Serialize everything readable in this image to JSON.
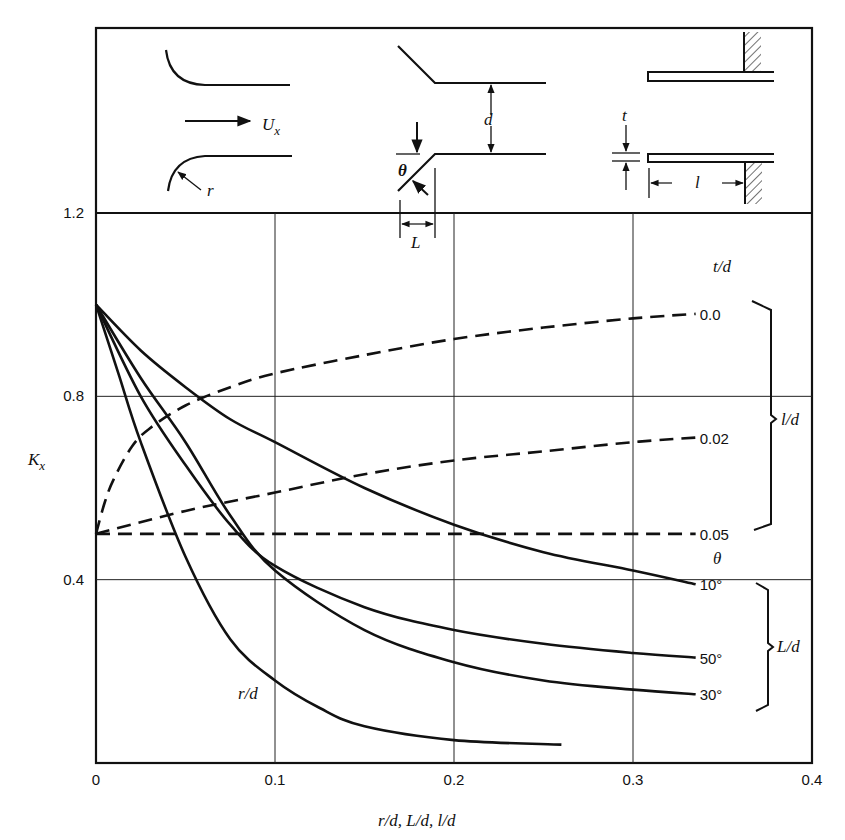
{
  "chart_data": {
    "type": "line",
    "title": "",
    "xlabel": "r/d, L/d, l/d",
    "ylabel": "K_x",
    "xlim": [
      0,
      0.4
    ],
    "ylim": [
      0,
      1.2
    ],
    "x_ticks": [
      "0",
      "0.1",
      "0.2",
      "0.3",
      "0.4"
    ],
    "y_ticks": [
      "0.4",
      "0.8",
      "1.2"
    ],
    "grid": true,
    "legend_groups": [
      {
        "header": "t/d",
        "bracket_label": "l/d",
        "style": "dashed",
        "entries": [
          "0.0",
          "0.02",
          "0.05"
        ]
      },
      {
        "header": "θ",
        "bracket_label": "L/d",
        "style": "solid",
        "entries": [
          "10°",
          "50°",
          "30°"
        ]
      }
    ],
    "series": [
      {
        "name": "t/d = 0.0",
        "group": "l/d",
        "style": "dashed",
        "label": "0.0",
        "x": [
          0,
          0.005,
          0.01,
          0.02,
          0.03,
          0.05,
          0.075,
          0.1,
          0.15,
          0.2,
          0.25,
          0.3,
          0.335
        ],
        "y": [
          0.5,
          0.57,
          0.62,
          0.69,
          0.73,
          0.78,
          0.82,
          0.85,
          0.89,
          0.925,
          0.95,
          0.97,
          0.98
        ]
      },
      {
        "name": "t/d = 0.02",
        "group": "l/d",
        "style": "dashed",
        "label": "0.02",
        "x": [
          0,
          0.05,
          0.1,
          0.15,
          0.2,
          0.25,
          0.3,
          0.335
        ],
        "y": [
          0.5,
          0.55,
          0.59,
          0.63,
          0.66,
          0.68,
          0.7,
          0.71
        ]
      },
      {
        "name": "t/d = 0.05",
        "group": "l/d",
        "style": "dashed",
        "label": "0.05",
        "x": [
          0,
          0.1,
          0.2,
          0.3,
          0.335
        ],
        "y": [
          0.5,
          0.5,
          0.5,
          0.5,
          0.5
        ]
      },
      {
        "name": "θ = 10°",
        "group": "L/d",
        "style": "solid",
        "label": "10°",
        "x": [
          0,
          0.025,
          0.05,
          0.075,
          0.1,
          0.15,
          0.2,
          0.25,
          0.3,
          0.335
        ],
        "y": [
          1.0,
          0.9,
          0.82,
          0.75,
          0.7,
          0.6,
          0.52,
          0.46,
          0.42,
          0.39
        ]
      },
      {
        "name": "θ = 50°",
        "group": "L/d",
        "style": "solid",
        "label": "50°",
        "x": [
          0,
          0.025,
          0.05,
          0.075,
          0.1,
          0.15,
          0.2,
          0.25,
          0.3,
          0.335
        ],
        "y": [
          1.0,
          0.8,
          0.65,
          0.52,
          0.43,
          0.34,
          0.29,
          0.26,
          0.24,
          0.23
        ]
      },
      {
        "name": "θ = 30°",
        "group": "L/d",
        "style": "solid",
        "label": "30°",
        "x": [
          0,
          0.025,
          0.05,
          0.075,
          0.1,
          0.15,
          0.2,
          0.25,
          0.3,
          0.335
        ],
        "y": [
          1.0,
          0.84,
          0.7,
          0.54,
          0.42,
          0.29,
          0.22,
          0.18,
          0.16,
          0.15
        ]
      },
      {
        "name": "r/d",
        "group": "r/d",
        "style": "solid",
        "label": "r/d",
        "x": [
          0,
          0.0125,
          0.025,
          0.05,
          0.075,
          0.1,
          0.125,
          0.15,
          0.2,
          0.26
        ],
        "y": [
          1.0,
          0.85,
          0.7,
          0.45,
          0.27,
          0.18,
          0.12,
          0.08,
          0.05,
          0.04
        ]
      }
    ],
    "inset_diagrams": [
      {
        "name": "rounded-inlet",
        "labels": [
          "U_x",
          "r"
        ]
      },
      {
        "name": "chamfered-inlet",
        "labels": [
          "d",
          "θ",
          "L"
        ]
      },
      {
        "name": "reentrant-inlet",
        "labels": [
          "t",
          "l"
        ]
      }
    ]
  },
  "labels": {
    "ylabel": "K",
    "ylabel_sub": "x",
    "xlabel": "r/d, L/d, l/d",
    "td_header": "t/d",
    "theta_header": "θ",
    "ld_bracket": "l/d",
    "Ld_bracket": "L/d",
    "rd_curve": "r/d",
    "ux": "U",
    "ux_sub": "x",
    "r": "r",
    "d": "d",
    "theta": "θ",
    "L": "L",
    "t": "t",
    "l": "l"
  }
}
